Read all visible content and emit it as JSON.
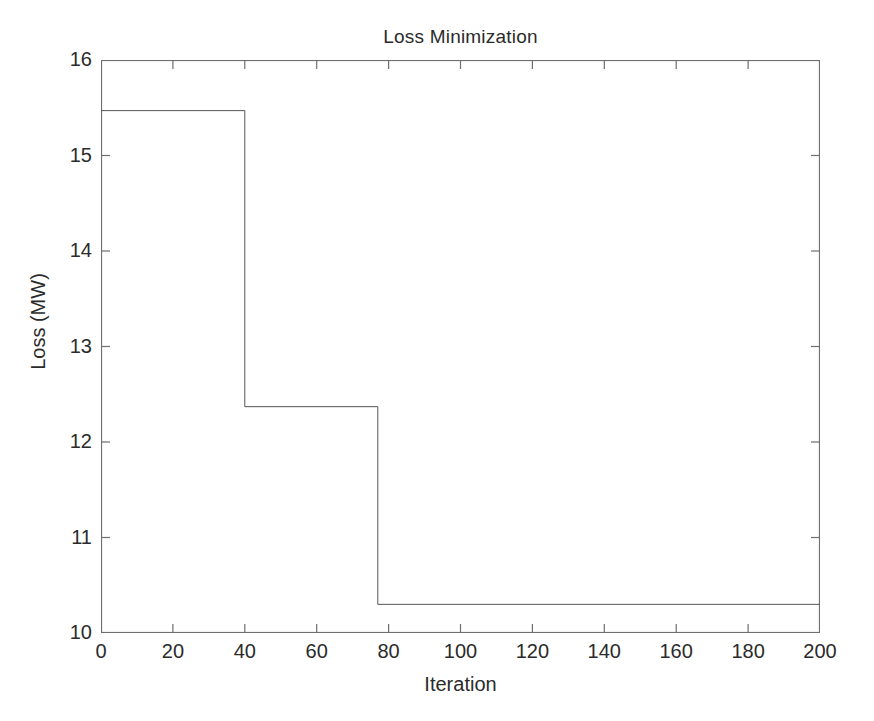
{
  "chart_data": {
    "type": "line",
    "title": "Loss Minimization",
    "xlabel": "Iteration",
    "ylabel": "Loss (MW)",
    "xlim": [
      0,
      200
    ],
    "ylim": [
      10,
      16
    ],
    "xticks": [
      0,
      20,
      40,
      60,
      80,
      100,
      120,
      140,
      160,
      180,
      200
    ],
    "yticks": [
      10,
      11,
      12,
      13,
      14,
      15,
      16
    ],
    "xtick_labels": [
      "0",
      "20",
      "40",
      "60",
      "80",
      "100",
      "120",
      "140",
      "160",
      "180",
      "200"
    ],
    "ytick_labels": [
      "10",
      "11",
      "12",
      "13",
      "14",
      "15",
      "16"
    ],
    "grid": false,
    "legend": null,
    "line_color": "#555555",
    "line_width": 1,
    "style": "step",
    "series": [
      {
        "name": "Loss",
        "x": [
          0,
          40,
          40,
          77,
          77,
          200
        ],
        "y": [
          15.47,
          15.47,
          12.37,
          12.37,
          10.3,
          10.3
        ]
      }
    ],
    "steps": [
      {
        "from_iteration": 0,
        "to_iteration": 40,
        "value": 15.47
      },
      {
        "from_iteration": 40,
        "to_iteration": 77,
        "value": 12.37
      },
      {
        "from_iteration": 77,
        "to_iteration": 200,
        "value": 10.3
      }
    ]
  }
}
